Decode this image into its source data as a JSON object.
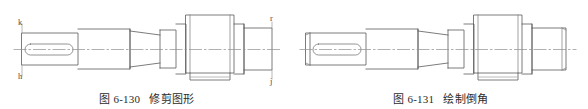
{
  "page": {
    "background_color": "#ffffff",
    "line_color": "#5a5a5a",
    "faint_line_color": "#9a9a9a",
    "centerline_color": "#8f8f8f",
    "text_color": "#2b2b2b"
  },
  "figures": [
    {
      "id": "figure-6-130",
      "caption_number": "图 6-130",
      "caption_title": "修剪图形",
      "subject": "stepped-shaft-engineering-drawing",
      "has_chamfers": false,
      "has_extension_lines": true,
      "labels": [
        {
          "key": "k",
          "text": "k",
          "position": "top-left"
        },
        {
          "key": "h",
          "text": "h",
          "position": "bottom-left"
        },
        {
          "key": "r",
          "text": "r",
          "position": "top-right"
        },
        {
          "key": "j",
          "text": "j",
          "position": "bottom-right"
        }
      ],
      "features": [
        "keyway-slot-left-end",
        "stepped-cylindrical-sections",
        "tapered-section",
        "central-boss",
        "bottom-flange-under-boss",
        "right-end-step",
        "horizontal-centerline"
      ]
    },
    {
      "id": "figure-6-131",
      "caption_number": "图 6-131",
      "caption_title": "绘制倒角",
      "subject": "stepped-shaft-engineering-drawing",
      "has_chamfers": true,
      "has_extension_lines": false,
      "labels": [],
      "features": [
        "keyway-slot-left-end",
        "chamfer-left-end",
        "stepped-cylindrical-sections",
        "tapered-section",
        "central-boss",
        "bottom-flange-under-boss",
        "chamfer-right-end",
        "right-end-step",
        "horizontal-centerline"
      ]
    }
  ]
}
